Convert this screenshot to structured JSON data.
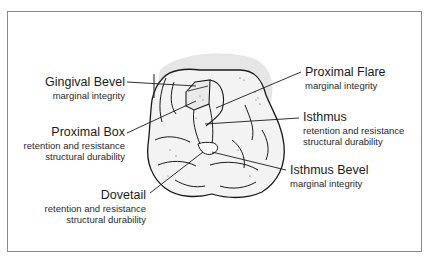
{
  "diagram": {
    "colors": {
      "frame": "#8a8a8a",
      "shadow": "#e6e6e6",
      "tooth_fill": "#f3f3f3",
      "line": "#1a1a1a"
    },
    "labels": [
      {
        "id": "gingival-bevel",
        "title": "Gingival Bevel",
        "lines": [
          "marginal integrity"
        ]
      },
      {
        "id": "proximal-box",
        "title": "Proximal Box",
        "lines": [
          "retention and resistance",
          "structural durability"
        ]
      },
      {
        "id": "dovetail",
        "title": "Dovetail",
        "lines": [
          "retention and resistance",
          "structural durability"
        ]
      },
      {
        "id": "proximal-flare",
        "title": "Proximal Flare",
        "lines": [
          "marginal integrity"
        ]
      },
      {
        "id": "isthmus",
        "title": "Isthmus",
        "lines": [
          "retention and resistance",
          "structural durability"
        ]
      },
      {
        "id": "isthmus-bevel",
        "title": "Isthmus Bevel",
        "lines": [
          "marginal integrity"
        ]
      }
    ]
  }
}
